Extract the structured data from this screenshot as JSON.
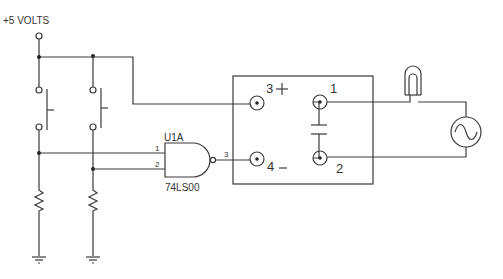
{
  "diagram": {
    "type": "circuit-schematic",
    "supply_label": "+5 VOLTS",
    "gate": {
      "ref": "U1A",
      "part": "74LS00",
      "function": "NAND",
      "pins": {
        "in1": "1",
        "in2": "2",
        "out": "3"
      }
    },
    "relay_box": {
      "terminals": [
        {
          "number": "3",
          "polarity": "+"
        },
        {
          "number": "4",
          "polarity": "–"
        },
        {
          "number": "1",
          "polarity": ""
        },
        {
          "number": "2",
          "polarity": ""
        }
      ]
    },
    "components": [
      "pushbutton-switch-1",
      "pushbutton-switch-2",
      "resistor-1",
      "resistor-2",
      "ground-1",
      "ground-2",
      "capacitor",
      "lamp",
      "ac-source"
    ],
    "colors": {
      "line": "#3a3a3a",
      "background": "#ffffff"
    }
  }
}
